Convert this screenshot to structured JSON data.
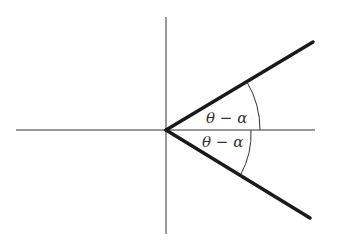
{
  "diagram": {
    "labels": {
      "upper_angle": "θ − α",
      "lower_angle": "θ − α"
    },
    "colors": {
      "axes": "#333333",
      "rays": "#1a1a1a",
      "background": "#ffffff"
    }
  }
}
